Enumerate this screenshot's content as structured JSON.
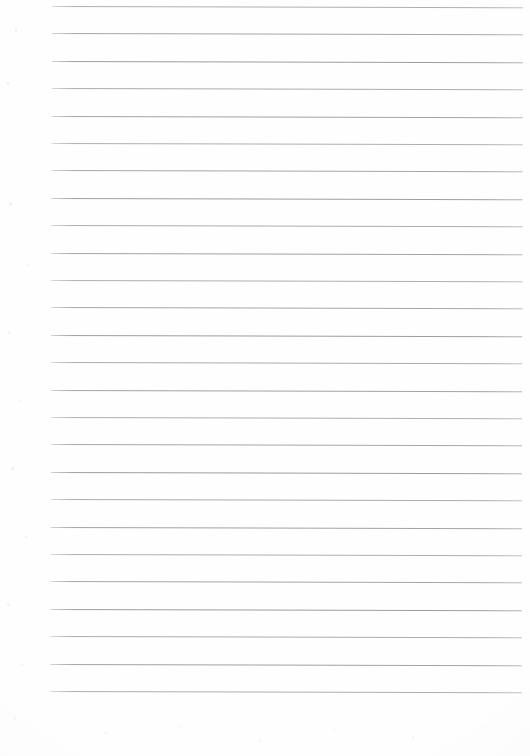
{
  "document": {
    "kind": "scanned-lined-paper",
    "title": "Lined Notebook Paper",
    "page_width": 530,
    "page_height": 756,
    "paper_color": "#fefefe",
    "rule_color": "#9a9aa0",
    "content_text": "",
    "handwriting": "",
    "printed_text": "",
    "margin_line": "none",
    "header": "",
    "footer": "",
    "page_number": ""
  },
  "ruling": {
    "line_count": 26,
    "first_line_y": 6,
    "spacing": 27.4,
    "line_start_x": 52,
    "line_end_x": 523,
    "line_thickness": 1,
    "skew_degrees": 0.13,
    "lines_y": [
      6,
      33.4,
      60.8,
      88.2,
      115.6,
      143,
      170.4,
      197.8,
      225.2,
      252.6,
      280,
      307.4,
      334.8,
      362.2,
      389.6,
      417,
      444.4,
      471.8,
      499.2,
      526.6,
      554,
      581.4,
      608.8,
      636.2,
      663.6,
      691
    ]
  },
  "margins": {
    "left_blank_width": 52,
    "right_blank_width": 7,
    "top_blank_height": 6,
    "bottom_blank_height": 65
  }
}
